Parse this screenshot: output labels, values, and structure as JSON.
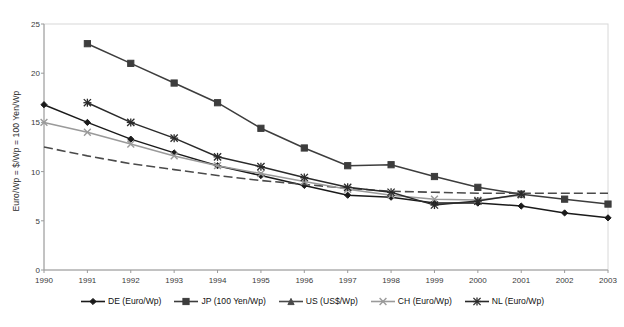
{
  "chart_data": {
    "type": "line",
    "title": "",
    "xlabel": "",
    "ylabel": "Euro/Wp = $/Wp = 100 Yen/Wp",
    "x": [
      1990,
      1991,
      1992,
      1993,
      1994,
      1995,
      1996,
      1997,
      1998,
      1999,
      2000,
      2001,
      2002,
      2003
    ],
    "xtick_labels": [
      "1990",
      "1991",
      "1992",
      "1993",
      "1994",
      "1995",
      "1996",
      "1997",
      "1998",
      "1999",
      "2000",
      "2001",
      "2002",
      "2003"
    ],
    "ytick_labels": [
      "0",
      "5",
      "10",
      "15",
      "20",
      "25"
    ],
    "yticks": [
      0,
      5,
      10,
      15,
      20,
      25
    ],
    "ylim": [
      0,
      25
    ],
    "xlim": [
      1990,
      2003
    ],
    "grid": false,
    "legend_position": "bottom",
    "series": [
      {
        "name": "DE (Euro/Wp)",
        "marker": "diamond",
        "color": "#1a1a1a",
        "dash": "solid",
        "values": [
          16.8,
          15.0,
          13.3,
          11.9,
          10.6,
          9.6,
          8.6,
          7.6,
          7.4,
          6.8,
          6.8,
          6.5,
          5.8,
          5.3
        ]
      },
      {
        "name": "JP (100 Yen/Wp)",
        "marker": "square",
        "color": "#3d3d3d",
        "dash": "solid",
        "values": [
          null,
          23.0,
          21.0,
          19.0,
          17.0,
          14.4,
          12.4,
          10.6,
          10.7,
          9.5,
          8.4,
          7.7,
          7.2,
          6.7
        ]
      },
      {
        "name": "US (US$/Wp)",
        "marker": "triangle",
        "color": "#4a4a4a",
        "dash": "dashed",
        "values": [
          12.5,
          11.6,
          10.8,
          10.2,
          9.6,
          9.1,
          8.7,
          8.3,
          8.0,
          7.9,
          7.8,
          7.8,
          7.8,
          7.8
        ]
      },
      {
        "name": "CH (Euro/Wp)",
        "marker": "x",
        "color": "#9a9a9a",
        "dash": "solid",
        "values": [
          15.0,
          14.0,
          12.8,
          11.6,
          10.6,
          9.8,
          9.0,
          8.2,
          7.6,
          7.2,
          7.1,
          7.6,
          null,
          null
        ]
      },
      {
        "name": "NL (Euro/Wp)",
        "marker": "asterisk",
        "color": "#2a2a2a",
        "dash": "solid",
        "values": [
          null,
          17.0,
          15.0,
          13.4,
          11.5,
          10.5,
          9.4,
          8.4,
          7.9,
          6.6,
          7.0,
          7.7,
          null,
          null
        ]
      }
    ]
  }
}
